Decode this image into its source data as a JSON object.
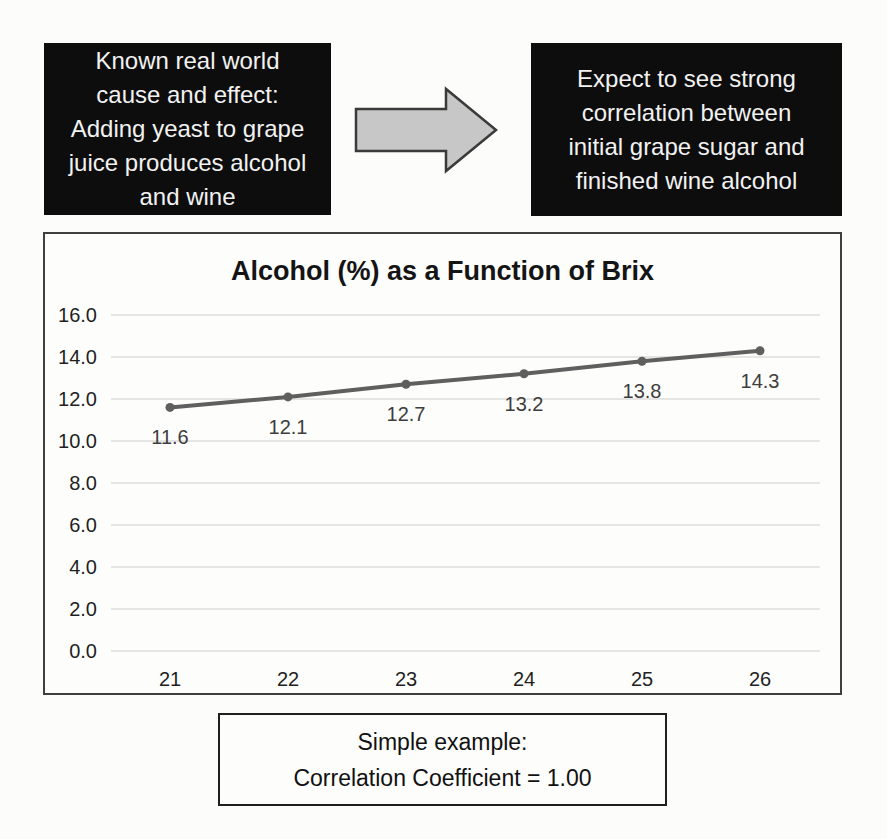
{
  "flow": {
    "cause_box": {
      "text": "Known real world\ncause and effect:\nAdding yeast to grape\njuice produces alcohol\nand wine",
      "bg": "#0d0d0d",
      "text_color": "#f2f2f2"
    },
    "arrow": {
      "direction": "right",
      "fill": "#c7c7c7",
      "stroke": "#3a3a3a"
    },
    "effect_box": {
      "text": "Expect to see strong\ncorrelation between\ninitial grape sugar and\nfinished wine alcohol",
      "bg": "#0d0d0d",
      "text_color": "#f2f2f2"
    }
  },
  "chart_data": {
    "type": "line",
    "title": "Alcohol (%) as a Function of Brix",
    "x": [
      21,
      22,
      23,
      24,
      25,
      26
    ],
    "xtick_labels": [
      "21",
      "22",
      "23",
      "24",
      "25",
      "26"
    ],
    "series": [
      {
        "name": "Alcohol (%)",
        "values": [
          11.6,
          12.1,
          12.7,
          13.2,
          13.8,
          14.3
        ]
      }
    ],
    "data_labels": [
      "11.6",
      "12.1",
      "12.7",
      "13.2",
      "13.8",
      "14.3"
    ],
    "xlabel": "",
    "ylabel": "",
    "ylim": [
      0,
      16
    ],
    "ytick_step": 2,
    "ytick_labels": [
      "0.0",
      "2.0",
      "4.0",
      "6.0",
      "8.0",
      "10.0",
      "12.0",
      "14.0",
      "16.0"
    ],
    "grid": true,
    "legend": "none",
    "line_color": "#5f5f5f",
    "marker": "circle",
    "gridline_color": "#dcdcdc",
    "label_color": "#3d3d3d",
    "tick_color": "#1f1f1f"
  },
  "caption": {
    "text": "Simple example:\nCorrelation Coefficient = 1.00"
  }
}
